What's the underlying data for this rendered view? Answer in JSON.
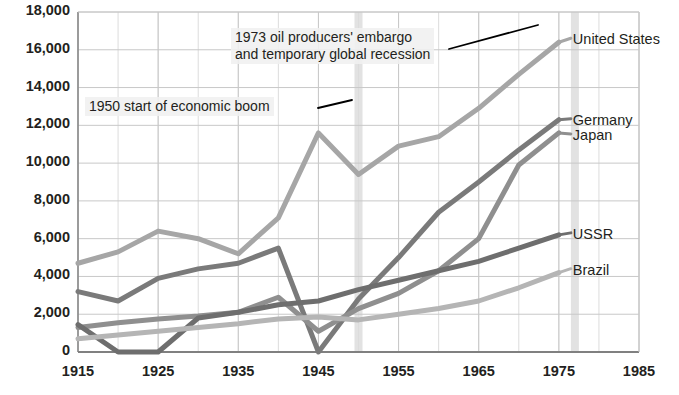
{
  "title_clipped": "Gross domestic product (US$ billions)",
  "chart_data": {
    "type": "line",
    "title": "Gross domestic product (US$ billions)",
    "xlabel": "",
    "ylabel": "",
    "xlim": [
      1915,
      1985
    ],
    "ylim": [
      0,
      18000
    ],
    "grid": true,
    "legend_position": "right-inline-labels",
    "y_ticks": [
      "0",
      "2,000",
      "4,000",
      "6,000",
      "8,000",
      "10,000",
      "12,000",
      "14,000",
      "16,000",
      "18,000"
    ],
    "y_tick_values": [
      0,
      2000,
      4000,
      6000,
      8000,
      10000,
      12000,
      14000,
      16000,
      18000
    ],
    "x_ticks": [
      "1915",
      "1925",
      "1935",
      "1945",
      "1955",
      "1965",
      "1975",
      "1985"
    ],
    "x_tick_values": [
      1915,
      1925,
      1935,
      1945,
      1955,
      1965,
      1975,
      1985
    ],
    "x_minor_step": 5,
    "x": [
      1915,
      1920,
      1925,
      1930,
      1935,
      1940,
      1945,
      1950,
      1955,
      1960,
      1965,
      1970,
      1975
    ],
    "series": [
      {
        "name": "United States",
        "color": "#a6a6a6",
        "values": [
          4700,
          5300,
          6400,
          6000,
          5200,
          7100,
          11600,
          9400,
          10900,
          11400,
          12900,
          14700,
          16400
        ]
      },
      {
        "name": "Germany",
        "color": "#7a7a7a",
        "values": [
          3200,
          2700,
          3900,
          4400,
          4700,
          5500,
          0,
          2800,
          5000,
          7400,
          9000,
          10700,
          12300
        ]
      },
      {
        "name": "Japan",
        "color": "#8f8f8f",
        "values": [
          1300,
          1550,
          1750,
          1900,
          2100,
          2900,
          1100,
          2300,
          3100,
          4300,
          6000,
          9900,
          11600
        ]
      },
      {
        "name": "USSR",
        "color": "#6e6e6e",
        "values": [
          1450,
          0,
          0,
          1800,
          2100,
          2500,
          2700,
          3300,
          3800,
          4300,
          4800,
          5500,
          6200
        ]
      },
      {
        "name": "Brazil",
        "color": "#b5b5b5",
        "values": [
          700,
          900,
          1100,
          1300,
          1500,
          1750,
          1850,
          1700,
          2000,
          2300,
          2700,
          3400,
          4200
        ]
      }
    ],
    "annotations": [
      {
        "id": "annot-1973",
        "line1": "1973 oil producers' embargo",
        "line2": "and temporary global recession",
        "target_year": 1977,
        "has_leader_line": true
      },
      {
        "id": "annot-1950",
        "line1": "1950 start of economic boom",
        "line2": "",
        "target_year": 1950,
        "has_leader_line": true
      }
    ],
    "highlight_bands": [
      {
        "id": "band-1950",
        "year": 1950,
        "color": "#e2e2e2"
      },
      {
        "id": "band-1977",
        "year": 1977,
        "color": "#e2e2e2"
      }
    ],
    "colors": {
      "axis": "#808080",
      "gridline_major": "#c8c8c8",
      "gridline_minor": "#dcdcdc",
      "text": "#231f20",
      "leader_line": "#000000"
    }
  },
  "series_labels": [
    {
      "name": "United States"
    },
    {
      "name": "Germany"
    },
    {
      "name": "Japan"
    },
    {
      "name": "USSR"
    },
    {
      "name": "Brazil"
    }
  ]
}
